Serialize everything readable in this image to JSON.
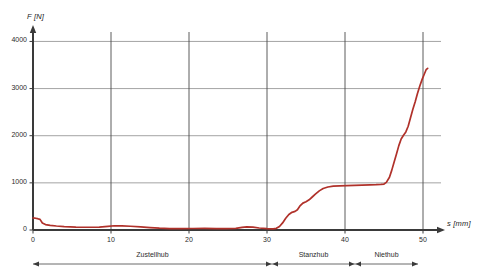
{
  "chart_data": {
    "type": "line",
    "title": "",
    "xlabel": "s [mm]",
    "ylabel": "F [N]",
    "xlim": [
      0,
      55
    ],
    "ylim": [
      0,
      4300
    ],
    "grid": true,
    "legend": "none",
    "xticks": [
      0,
      10,
      20,
      30,
      40,
      50
    ],
    "yticks": [
      0,
      1000,
      2000,
      3000,
      4000
    ],
    "xtick_labels": [
      "0",
      "10",
      "20",
      "30",
      "40",
      "50"
    ],
    "ytick_labels": [
      "0",
      "1000",
      "2000",
      "3000",
      "4000"
    ],
    "series": [
      {
        "name": "Force curve",
        "color": "#b0312a",
        "x": [
          0,
          0.3,
          0.6,
          0.9,
          1.2,
          1.6,
          2.2,
          3.0,
          4.0,
          5.5,
          7.0,
          8.5,
          9.6,
          10.4,
          11.4,
          12.5,
          13.8,
          15.0,
          16.2,
          17.5,
          19.0,
          20.5,
          22.0,
          23.5,
          24.8,
          26.0,
          26.8,
          27.4,
          28.2,
          29.0,
          30.0,
          30.8,
          31.2,
          31.6,
          32.0,
          32.4,
          32.8,
          33.2,
          33.6,
          33.9,
          34.2,
          34.6,
          35.0,
          35.4,
          35.8,
          36.2,
          36.7,
          37.2,
          37.8,
          38.5,
          39.3,
          40.2,
          41.2,
          42.2,
          43.2,
          44.0,
          44.6,
          45.0,
          45.3,
          45.7,
          46.0,
          46.3,
          46.6,
          46.9,
          47.2,
          47.5,
          47.8,
          48.1,
          48.4,
          48.7,
          49.0,
          49.3,
          49.6,
          49.9,
          50.2,
          50.4,
          50.6
        ],
        "y": [
          255,
          250,
          240,
          225,
          150,
          115,
          100,
          85,
          72,
          62,
          58,
          62,
          78,
          90,
          88,
          80,
          68,
          52,
          38,
          30,
          28,
          32,
          34,
          30,
          28,
          35,
          55,
          68,
          60,
          42,
          28,
          25,
          35,
          75,
          150,
          250,
          330,
          375,
          395,
          430,
          505,
          570,
          600,
          640,
          700,
          760,
          830,
          880,
          912,
          930,
          938,
          942,
          948,
          952,
          958,
          962,
          968,
          975,
          1010,
          1120,
          1270,
          1440,
          1610,
          1790,
          1930,
          2010,
          2080,
          2200,
          2380,
          2560,
          2720,
          2900,
          3060,
          3200,
          3320,
          3400,
          3430
        ]
      }
    ],
    "annotations": {
      "phase_bar_label": "Process phases",
      "phases": [
        {
          "name": "Zustellhub",
          "start_mm": 0,
          "end_mm": 31
        },
        {
          "name": "Stanzhub",
          "start_mm": 31,
          "end_mm": 41.5
        },
        {
          "name": "Niethub",
          "start_mm": 41.5,
          "end_mm": 49.5
        }
      ]
    }
  },
  "geometry": {
    "plot_left_px": 33,
    "plot_right_px": 441,
    "axis_x_px": 33,
    "y_zero_px": 230,
    "y_top_px": 32,
    "x_unit_px": 7.8,
    "y_per_px": 0.2,
    "phase_bar_y_px": 264,
    "phase_bar_left_px": 33,
    "phase_bar_right_px": 418,
    "phase_div1_px": 272,
    "phase_div2_px": 355
  },
  "style": {
    "curve_color": "#b0312a",
    "grid_color_h": "#9a9a9a",
    "grid_color_v": "#4a4a4a",
    "axis_color": "#3a3a3a",
    "text_color": "#2b2b2b",
    "background": "#ffffff"
  }
}
